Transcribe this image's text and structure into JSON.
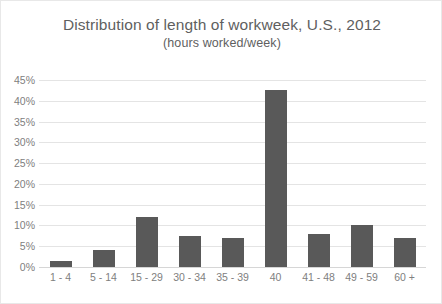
{
  "chart_data": {
    "type": "bar",
    "title": "Distribution of length of workweek, U.S., 2012",
    "subtitle": "(hours worked/week)",
    "xlabel": "",
    "ylabel": "",
    "categories": [
      "1 - 4",
      "5 - 14",
      "15 - 29",
      "30 - 34",
      "35 - 39",
      "40",
      "41 - 48",
      "49 - 59",
      "60 +"
    ],
    "values": [
      1.5,
      4,
      12,
      7.5,
      7,
      42.5,
      8,
      10,
      7
    ],
    "ylim": [
      0,
      45
    ],
    "ytick_labels": [
      "0%",
      "5%",
      "10%",
      "15%",
      "20%",
      "25%",
      "30%",
      "35%",
      "40%",
      "45%"
    ],
    "ytick_values": [
      0,
      5,
      10,
      15,
      20,
      25,
      30,
      35,
      40,
      45
    ],
    "grid": true,
    "legend": "none",
    "series": [
      {
        "name": "Share of workers",
        "values": [
          1.5,
          4,
          12,
          7.5,
          7,
          42.5,
          8,
          10,
          7
        ]
      }
    ],
    "colors": {
      "bar": "#595959",
      "gridline": "#e4e4e4",
      "axis": "#d6d6d6",
      "title_text": "#5f5f5f",
      "tick_text": "#808080",
      "background": "#ffffff",
      "border": "#e8e8e8"
    }
  }
}
